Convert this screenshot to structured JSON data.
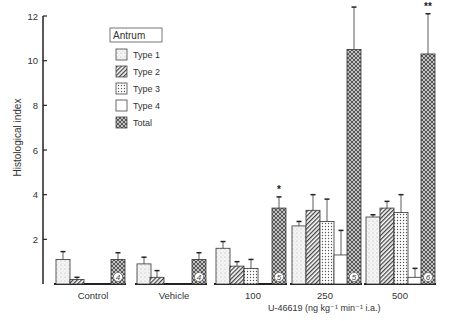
{
  "chart_data": {
    "type": "bar",
    "title": "Antrum",
    "xlabel": "U-46619 (ng kg⁻¹ min⁻¹ i.a.)",
    "ylabel": "Histological index",
    "ylim": [
      0,
      12
    ],
    "yticks": [
      "2",
      "4",
      "6",
      "8",
      "10",
      "12"
    ],
    "categories": [
      "Control",
      "Vehicle",
      "100",
      "250",
      "500"
    ],
    "legend": [
      "Type 1",
      "Type 2",
      "Type 3",
      "Type 4",
      "Total"
    ],
    "series": [
      {
        "name": "Type 1",
        "values": [
          1.1,
          0.9,
          1.6,
          2.6,
          3.0
        ],
        "errors": [
          0.35,
          0.3,
          0.3,
          0.2,
          0.1
        ]
      },
      {
        "name": "Type 2",
        "values": [
          0.2,
          0.3,
          0.8,
          3.3,
          3.4
        ],
        "errors": [
          0.1,
          0.3,
          0.2,
          0.7,
          0.3
        ]
      },
      {
        "name": "Type 3",
        "values": [
          0.0,
          0.0,
          0.7,
          2.8,
          3.2
        ],
        "errors": [
          0.0,
          0.0,
          0.4,
          1.0,
          0.8
        ]
      },
      {
        "name": "Type 4",
        "values": [
          0.0,
          0.0,
          0.0,
          1.3,
          0.3
        ],
        "errors": [
          0.0,
          0.0,
          0.0,
          1.1,
          0.4
        ]
      },
      {
        "name": "Total",
        "values": [
          1.1,
          1.1,
          3.4,
          10.5,
          10.3
        ],
        "errors": [
          0.3,
          0.3,
          0.5,
          1.9,
          1.8
        ]
      }
    ],
    "n": [
      "4",
      "4",
      "5",
      "5",
      "6"
    ],
    "significance": [
      "",
      "",
      "*",
      "**",
      "**"
    ]
  }
}
